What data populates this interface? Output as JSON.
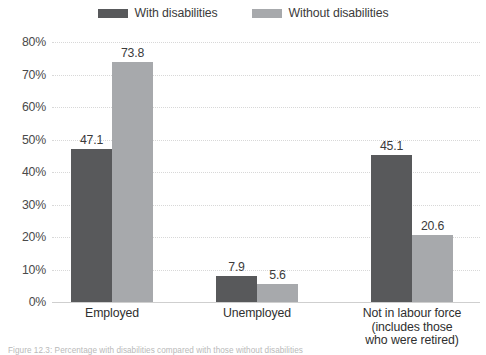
{
  "chart_data": {
    "type": "bar",
    "title": "",
    "xlabel": "",
    "ylabel": "",
    "ylim": [
      0,
      80
    ],
    "ytick_step": 10,
    "grid": true,
    "legend_position": "top-center",
    "value_label_format": "one-decimal",
    "categories": [
      "Employed",
      "Unemployed",
      "Not in labour force (includes those who were retired)"
    ],
    "category_lines": [
      [
        "Employed"
      ],
      [
        "Unemployed"
      ],
      [
        "Not in labour force",
        "(includes those",
        "who were retired)"
      ]
    ],
    "yticks": [
      "0%",
      "10%",
      "20%",
      "30%",
      "40%",
      "50%",
      "60%",
      "70%",
      "80%"
    ],
    "ytick_values": [
      0,
      10,
      20,
      30,
      40,
      50,
      60,
      70,
      80
    ],
    "series": [
      {
        "name": "With disabilities",
        "color": "#58595b",
        "values": [
          47.1,
          7.9,
          45.1
        ],
        "labels": [
          "47.1",
          "7.9",
          "45.1"
        ]
      },
      {
        "name": "Without disabilities",
        "color": "#a7a9ac",
        "values": [
          73.8,
          5.6,
          20.6
        ],
        "labels": [
          "73.8",
          "5.6",
          "20.6"
        ]
      }
    ]
  },
  "legend": {
    "entries": [
      {
        "label": "With disabilities",
        "color": "#58595b"
      },
      {
        "label": "Without disabilities",
        "color": "#a7a9ac"
      }
    ]
  },
  "colors": {
    "with_disabilities": "#58595b",
    "without_disabilities": "#a7a9ac",
    "gridline": "#d8d8d8",
    "axis": "#cfcfcf",
    "text": "#3b3b3b",
    "background": "#ffffff"
  },
  "caption": {
    "text": "Figure 12.3: Percentage with disabilities compared with those without disabilities",
    "truncated": true
  }
}
